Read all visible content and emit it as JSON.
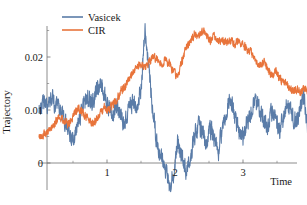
{
  "chart_data": {
    "type": "line",
    "title": "",
    "xlabel": "Time",
    "ylabel": "Trajectory",
    "xlim": [
      0,
      4
    ],
    "ylim": [
      -0.006,
      0.027
    ],
    "grid": false,
    "legend_position": "top-center",
    "x_ticks": [
      1,
      2,
      3
    ],
    "x_tick_labels": [
      "1",
      "2",
      "3"
    ],
    "x_minor_ticks": [
      0.5,
      1.5,
      2.5,
      3.5
    ],
    "y_ticks": [
      0,
      0.01,
      0.02
    ],
    "y_tick_labels": [
      "0",
      "0.01",
      "0.02"
    ],
    "y_minor_ticks": [
      0.005,
      0.015,
      0.025
    ],
    "series": [
      {
        "name": "Vasicek",
        "color": "#5A7CA8",
        "noise_seed": 20731,
        "noise_amp": 0.0019,
        "x": [
          0.0,
          0.06,
          0.12,
          0.18,
          0.24,
          0.3,
          0.36,
          0.42,
          0.48,
          0.54,
          0.6,
          0.66,
          0.72,
          0.78,
          0.84,
          0.9,
          0.96,
          1.02,
          1.08,
          1.14,
          1.2,
          1.26,
          1.32,
          1.38,
          1.44,
          1.5,
          1.56,
          1.62,
          1.68,
          1.74,
          1.8,
          1.86,
          1.92,
          1.98,
          2.04,
          2.1,
          2.16,
          2.22,
          2.28,
          2.34,
          2.4,
          2.46,
          2.52,
          2.58,
          2.64,
          2.7,
          2.76,
          2.82,
          2.88,
          2.94,
          3.0,
          3.06,
          3.12,
          3.18,
          3.24,
          3.3,
          3.36,
          3.42,
          3.48,
          3.54,
          3.6,
          3.66,
          3.72,
          3.78,
          3.84,
          3.9,
          3.96,
          4.0
        ],
        "values": [
          0.01,
          0.0118,
          0.0106,
          0.0125,
          0.0112,
          0.0098,
          0.0088,
          0.007,
          0.0048,
          0.0058,
          0.0086,
          0.0106,
          0.0124,
          0.011,
          0.0132,
          0.015,
          0.0128,
          0.0106,
          0.0094,
          0.0108,
          0.009,
          0.0074,
          0.0098,
          0.0118,
          0.0102,
          0.014,
          0.025,
          0.0168,
          0.009,
          0.003,
          0.0012,
          -0.001,
          -0.0046,
          -0.002,
          0.0038,
          0.0016,
          -0.0016,
          0.0006,
          0.0048,
          0.0072,
          0.0056,
          0.0038,
          0.0062,
          0.005,
          0.0024,
          0.007,
          0.01,
          0.0126,
          0.0084,
          0.0062,
          0.0048,
          0.0074,
          0.0096,
          0.0118,
          0.01,
          0.0082,
          0.007,
          0.0096,
          0.008,
          0.0062,
          0.009,
          0.0112,
          0.0096,
          0.0074,
          0.01,
          0.0122,
          0.006,
          -0.002
        ]
      },
      {
        "name": "CIR",
        "color": "#E8743B",
        "noise_seed": 91457,
        "noise_amp": 0.0009,
        "x": [
          0.0,
          0.06,
          0.12,
          0.18,
          0.24,
          0.3,
          0.36,
          0.42,
          0.48,
          0.54,
          0.6,
          0.66,
          0.72,
          0.78,
          0.84,
          0.9,
          0.96,
          1.02,
          1.08,
          1.14,
          1.2,
          1.26,
          1.32,
          1.38,
          1.44,
          1.5,
          1.56,
          1.62,
          1.68,
          1.74,
          1.8,
          1.86,
          1.92,
          1.98,
          2.04,
          2.1,
          2.16,
          2.22,
          2.28,
          2.34,
          2.4,
          2.46,
          2.52,
          2.58,
          2.64,
          2.7,
          2.76,
          2.82,
          2.88,
          2.94,
          3.0,
          3.06,
          3.12,
          3.18,
          3.24,
          3.3,
          3.36,
          3.42,
          3.48,
          3.54,
          3.6,
          3.66,
          3.72,
          3.78,
          3.84,
          3.9,
          3.96,
          4.0
        ],
        "values": [
          0.005,
          0.0052,
          0.0058,
          0.0066,
          0.0078,
          0.0086,
          0.008,
          0.0072,
          0.0084,
          0.0096,
          0.0102,
          0.0092,
          0.0086,
          0.0074,
          0.008,
          0.0092,
          0.0104,
          0.01,
          0.0108,
          0.012,
          0.0134,
          0.0142,
          0.0156,
          0.0172,
          0.018,
          0.0186,
          0.0178,
          0.0192,
          0.0202,
          0.0196,
          0.0188,
          0.0194,
          0.0186,
          0.0172,
          0.016,
          0.0192,
          0.0216,
          0.023,
          0.0244,
          0.0236,
          0.0248,
          0.024,
          0.0232,
          0.0238,
          0.023,
          0.0234,
          0.0226,
          0.0232,
          0.0224,
          0.023,
          0.0222,
          0.0216,
          0.0208,
          0.0196,
          0.0184,
          0.0192,
          0.0178,
          0.0166,
          0.0172,
          0.016,
          0.0152,
          0.0144,
          0.0136,
          0.014,
          0.0134,
          0.0142,
          0.0132,
          0.0136
        ]
      }
    ]
  },
  "legend": {
    "entries": [
      {
        "label": "Vasicek",
        "color": "#5A7CA8"
      },
      {
        "label": "CIR",
        "color": "#E8743B"
      }
    ]
  },
  "axes": {
    "y_title": "Trajectory",
    "x_title": "Time",
    "axis_color": "#6e6e6e"
  }
}
